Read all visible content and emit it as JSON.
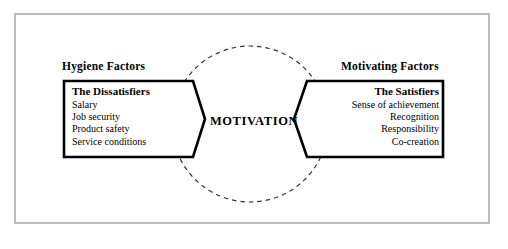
{
  "diagram": {
    "center_label": "MOTIVATION",
    "left": {
      "heading": "Hygiene Factors",
      "panel_title": "The Dissatisfiers",
      "items": [
        "Salary",
        "Job security",
        "Product safety",
        "Service conditions"
      ]
    },
    "right": {
      "heading": "Motivating Factors",
      "panel_title": "The Satisfiers",
      "items": [
        "Sense of achievement",
        "Recognition",
        "Responsibility",
        "Co-creation"
      ]
    },
    "colors": {
      "frame": "#bdbdbd",
      "shape_stroke": "#000000",
      "circle_stroke": "#333333",
      "background": "#ffffff",
      "text": "#000000"
    }
  }
}
